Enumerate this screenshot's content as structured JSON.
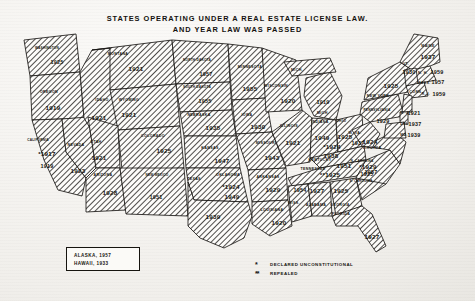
{
  "title": "STATES OPERATING UNDER A REAL ESTATE LICENSE LAW.\nAND YEAR LAW WAS PASSED",
  "legend": {
    "noncontiguous": [
      {
        "label": "ALASKA, 1957"
      },
      {
        "label": "HAWAII, 1933"
      }
    ],
    "symbols": [
      {
        "glyph": "*",
        "label": "DECLARED  UNCONSTITUTIONAL"
      },
      {
        "glyph": "**",
        "label": "REPEALED"
      }
    ]
  },
  "states": [
    {
      "name": "WASHINGTON",
      "year": "1925",
      "nx": 47,
      "ny": 48,
      "yx": 57,
      "yy": 62
    },
    {
      "name": "OREGON",
      "year": "1919",
      "nx": 49,
      "ny": 92,
      "yx": 53,
      "yy": 107
    },
    {
      "name": "CALIFORNIA",
      "year": "1919",
      "mark": "*1917",
      "nx": 38,
      "ny": 140,
      "yx": 47,
      "yy": 166,
      "mx": 47,
      "my": 153
    },
    {
      "name": "NEVADA",
      "year": "1923",
      "nx": 76,
      "ny": 145,
      "yx": 78,
      "yy": 170
    },
    {
      "name": "IDAHO",
      "year": "1921",
      "nx": 102,
      "ny": 100,
      "yx": 99,
      "yy": 117
    },
    {
      "name": "MONTANA",
      "year": "1921",
      "nx": 118,
      "ny": 54,
      "yx": 136,
      "yy": 68
    },
    {
      "name": "WYOMING",
      "year": "1921",
      "nx": 129,
      "ny": 100,
      "yx": 129,
      "yy": 114
    },
    {
      "name": "UTAH",
      "year": "1921",
      "nx": 96,
      "ny": 142,
      "yx": 99,
      "yy": 157
    },
    {
      "name": "ARIZONA",
      "year": "1928",
      "nx": 103,
      "ny": 175,
      "yx": 110,
      "yy": 192
    },
    {
      "name": "COLORADO",
      "year": "1925",
      "nx": 153,
      "ny": 136,
      "yx": 164,
      "yy": 150
    },
    {
      "name": "NEW MEXICO",
      "year": "1951",
      "nx": 157,
      "ny": 175,
      "yx": 156,
      "yy": 197
    },
    {
      "name": "NORTH DAKOTA",
      "year": "1957",
      "nx": 197,
      "ny": 60,
      "yx": 206,
      "yy": 74
    },
    {
      "name": "SOUTH DAKOTA",
      "year": "1955",
      "nx": 197,
      "ny": 87,
      "yx": 205,
      "yy": 101
    },
    {
      "name": "NEBRASKA",
      "year": "1935",
      "nx": 199,
      "ny": 115,
      "yx": 213,
      "yy": 127
    },
    {
      "name": "KANSAS",
      "year": "1947",
      "nx": 210,
      "ny": 148,
      "yx": 222,
      "yy": 160
    },
    {
      "name": "OKLAHOMA",
      "year": "1949",
      "mark": "*1924",
      "nx": 228,
      "ny": 175,
      "yx": 232,
      "yy": 196,
      "mx": 231,
      "my": 186
    },
    {
      "name": "TEXAS",
      "year": "1939",
      "nx": 194,
      "ny": 179,
      "yx": 213,
      "yy": 216
    },
    {
      "name": "MINNESOTA",
      "year": "1955",
      "nx": 250,
      "ny": 67,
      "yx": 250,
      "yy": 88
    },
    {
      "name": "IOWA",
      "year": "1930",
      "nx": 247,
      "ny": 115,
      "yx": 258,
      "yy": 126
    },
    {
      "name": "MISSOURI",
      "year": "1943",
      "nx": 266,
      "ny": 143,
      "yx": 272,
      "yy": 157
    },
    {
      "name": "ARKANSAS",
      "year": "1929",
      "nx": 268,
      "ny": 177,
      "yx": 273,
      "yy": 189
    },
    {
      "name": "LOUISIANA",
      "year": "1920",
      "nx": 272,
      "ny": 210,
      "yx": 279,
      "yy": 222
    },
    {
      "name": "WISCONSIN",
      "year": "1920",
      "nx": 276,
      "ny": 86,
      "yx": 288,
      "yy": 100
    },
    {
      "name": "ILLINOIS",
      "year": "1921",
      "nx": 289,
      "ny": 126,
      "yx": 293,
      "yy": 142
    },
    {
      "name": "MICH.",
      "year": "1919",
      "nx": 297,
      "ny": 70,
      "yx": 323,
      "yy": 102
    },
    {
      "name": "MICH.",
      "year": "",
      "nx": 323,
      "ny": 113,
      "yx": 0,
      "yy": 0
    },
    {
      "name": "INDIANA",
      "year": "1949",
      "nx": 320,
      "ny": 122,
      "yx": 322,
      "yy": 137
    },
    {
      "name": "OHIO",
      "year": "1925",
      "nx": 341,
      "ny": 121,
      "yx": 345,
      "yy": 136
    },
    {
      "name": "KENTUCKY",
      "year": "1938",
      "mark": "*1924",
      "nx": 320,
      "ny": 160,
      "yx": 331,
      "yy": 155,
      "mx": 332,
      "my": 146
    },
    {
      "name": "TENNESSEE",
      "year": "1951",
      "mark": "**1925",
      "nx": 313,
      "ny": 169,
      "yx": 344,
      "yy": 165,
      "mx": 330,
      "my": 174
    },
    {
      "name": "MISS.",
      "year": "1954",
      "nx": 294,
      "ny": 203,
      "yx": 300,
      "yy": 190
    },
    {
      "name": "ALABAMA",
      "year": "1927",
      "nx": 316,
      "ny": 205,
      "yx": 317,
      "yy": 190
    },
    {
      "name": "GEORGIA",
      "year": "1925",
      "nx": 340,
      "ny": 205,
      "yx": 341,
      "yy": 190
    },
    {
      "name": "FLORIDA",
      "year": "1927",
      "nx": 341,
      "ny": 214,
      "yx": 372,
      "yy": 236
    },
    {
      "name": "S. CAROLINA",
      "year": "1925",
      "nx": 361,
      "ny": 181,
      "yx": 367,
      "yy": 174
    },
    {
      "name": "N. CAROLINA",
      "year": "1957",
      "mark": "*1929",
      "nx": 362,
      "ny": 161,
      "yx": 371,
      "yy": 172,
      "mx": 368,
      "my": 166
    },
    {
      "name": "VIRGINIA",
      "year": "1924",
      "nx": 372,
      "ny": 148,
      "yx": 370,
      "yy": 141
    },
    {
      "name": "W. VA.",
      "year": "1937",
      "nx": 355,
      "ny": 133,
      "yx": 358,
      "yy": 143
    },
    {
      "name": "NEW YORK",
      "year": "1925",
      "nx": 378,
      "ny": 96,
      "yx": 391,
      "yy": 85
    },
    {
      "name": "PENNSYLVANIA",
      "year": "1929",
      "nx": 377,
      "ny": 110,
      "yx": 383,
      "yy": 121
    },
    {
      "name": "N. J.",
      "year": "1921",
      "nx": 405,
      "ny": 113,
      "yx": 414,
      "yy": 113
    },
    {
      "name": "DEL.",
      "year": "1937",
      "nx": 405,
      "ny": 124,
      "yx": 415,
      "yy": 124
    },
    {
      "name": "MD.",
      "year": "1939",
      "nx": 404,
      "ny": 135,
      "yx": 414,
      "yy": 135
    },
    {
      "name": "MAINE",
      "year": "1937",
      "nx": 428,
      "ny": 46,
      "yx": 428,
      "yy": 56
    },
    {
      "name": "VT.",
      "year": "1930",
      "nx": 406,
      "ny": 64,
      "yx": 409,
      "yy": 72
    },
    {
      "name": "N. H.",
      "year": "1959",
      "nx": 423,
      "ny": 73,
      "yx": 437,
      "yy": 72
    },
    {
      "name": "MASS.",
      "year": "1957",
      "nx": 424,
      "ny": 83,
      "yx": 438,
      "yy": 82
    },
    {
      "name": "R. I.",
      "year": "1959",
      "nx": 426,
      "ny": 94,
      "yx": 439,
      "yy": 94
    },
    {
      "name": "CONN.",
      "year": "",
      "nx": 416,
      "ny": 92,
      "yx": 0,
      "yy": 0
    }
  ]
}
